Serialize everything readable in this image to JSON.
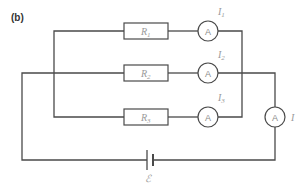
{
  "figure": {
    "part_label": "(b)"
  },
  "components": {
    "resistors": [
      {
        "id": "R1",
        "symbol": "R",
        "subscript": "1"
      },
      {
        "id": "R2",
        "symbol": "R",
        "subscript": "2"
      },
      {
        "id": "R3",
        "symbol": "R",
        "subscript": "3"
      }
    ],
    "ammeters": [
      {
        "id": "A1",
        "glyph": "A",
        "current_symbol": "I",
        "current_subscript": "1"
      },
      {
        "id": "A2",
        "glyph": "A",
        "current_symbol": "I",
        "current_subscript": "2"
      },
      {
        "id": "A3",
        "glyph": "A",
        "current_symbol": "I",
        "current_subscript": "3"
      },
      {
        "id": "A_main",
        "glyph": "A",
        "current_symbol": "I",
        "current_subscript": ""
      }
    ],
    "cell": {
      "label": "ℰ"
    }
  },
  "colors": {
    "wire": "#4a4a4a",
    "label": "#9a9a9a",
    "title": "#333333"
  }
}
